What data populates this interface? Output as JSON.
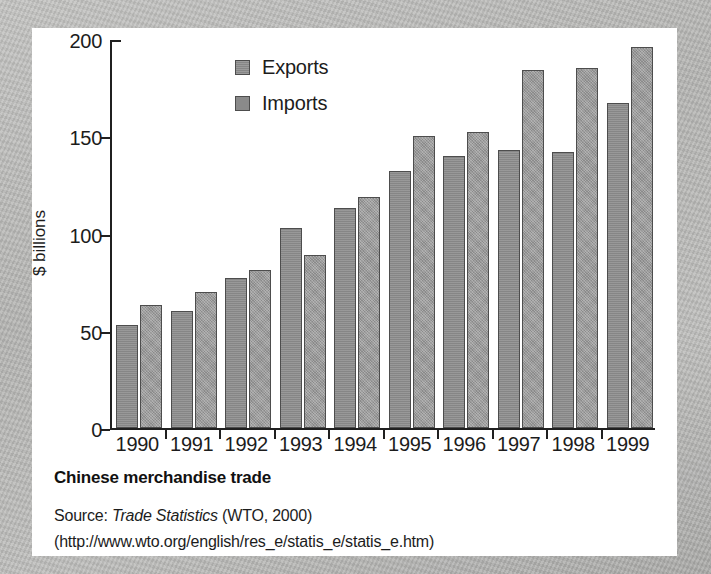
{
  "figure": {
    "caption_title": "Chinese merchandise trade",
    "source_prefix": "Source: ",
    "source_italic": "Trade Statistics",
    "source_suffix": " (WTO, 2000)",
    "source_url_line": "(http://www.wto.org/english/res_e/statis_e/statis_e.htm)"
  },
  "colors": {
    "exports": "#8d8d8d",
    "imports": "#979797",
    "axis": "#202020",
    "card": "#ffffff",
    "page": "#b9b9b7"
  },
  "chart_data": {
    "type": "bar",
    "title": "Chinese merchandise trade",
    "xlabel": "",
    "ylabel": "$ billions",
    "ylim": [
      0,
      200
    ],
    "yticks": [
      0,
      50,
      100,
      150,
      200
    ],
    "ytick_labels": [
      "0",
      "50",
      "100",
      "150",
      "200"
    ],
    "grid": false,
    "legend_position": "top-center",
    "categories": [
      "1990",
      "1991",
      "1992",
      "1993",
      "1994",
      "1995",
      "1996",
      "1997",
      "1998",
      "1999"
    ],
    "series": [
      {
        "name": "Exports",
        "values": [
          53,
          60,
          77,
          103,
          113,
          132,
          140,
          143,
          142,
          167
        ]
      },
      {
        "name": "Imports",
        "values": [
          63,
          70,
          81,
          89,
          119,
          150,
          152,
          184,
          185,
          196
        ]
      }
    ]
  }
}
